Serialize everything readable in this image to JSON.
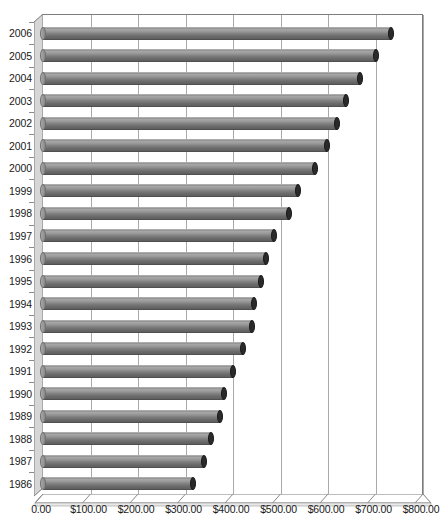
{
  "chart_data": {
    "type": "bar",
    "orientation": "horizontal",
    "title": "",
    "subtitle": "",
    "xlabel": "",
    "ylabel": "",
    "categories": [
      "2006",
      "2005",
      "2004",
      "2003",
      "2002",
      "2001",
      "2000",
      "1999",
      "1998",
      "1997",
      "1996",
      "1995",
      "1994",
      "1993",
      "1992",
      "1991",
      "1990",
      "1989",
      "1988",
      "1987",
      "1986"
    ],
    "values": [
      733,
      701,
      667,
      638,
      619,
      598,
      572,
      536,
      517,
      486,
      469,
      458,
      445,
      439,
      420,
      399,
      380,
      372,
      353,
      338,
      315
    ],
    "xlim": [
      0,
      800
    ],
    "xticks": [
      0,
      100,
      200,
      300,
      400,
      500,
      600,
      700,
      800
    ],
    "xtick_labels": [
      "0.00",
      "$100.00",
      "$200.00",
      "$300.00",
      "$400.00",
      "$500.00",
      "$600.00",
      "$700.00",
      "$800.00"
    ],
    "grid": "vertical",
    "legend": "none",
    "style": "3d-cylinder-bars",
    "bar_color": "#808080",
    "bar_cap_color": "#2a2a2a",
    "gridline_color": "#a9a9a9",
    "axis_color": "#7d7d7d",
    "background": "#ffffff"
  },
  "axes": {
    "y_ticks": [
      {
        "label": "2006",
        "value": 733
      },
      {
        "label": "2005",
        "value": 701
      },
      {
        "label": "2004",
        "value": 667
      },
      {
        "label": "2003",
        "value": 638
      },
      {
        "label": "2002",
        "value": 619
      },
      {
        "label": "2001",
        "value": 598
      },
      {
        "label": "2000",
        "value": 572
      },
      {
        "label": "1999",
        "value": 536
      },
      {
        "label": "1998",
        "value": 517
      },
      {
        "label": "1997",
        "value": 486
      },
      {
        "label": "1996",
        "value": 469
      },
      {
        "label": "1995",
        "value": 458
      },
      {
        "label": "1994",
        "value": 445
      },
      {
        "label": "1993",
        "value": 439
      },
      {
        "label": "1992",
        "value": 420
      },
      {
        "label": "1991",
        "value": 399
      },
      {
        "label": "1990",
        "value": 380
      },
      {
        "label": "1989",
        "value": 372
      },
      {
        "label": "1988",
        "value": 353
      },
      {
        "label": "1987",
        "value": 338
      },
      {
        "label": "1986",
        "value": 315
      }
    ]
  }
}
